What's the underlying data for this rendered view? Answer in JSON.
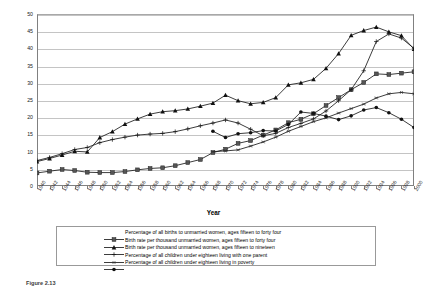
{
  "chart_data": {
    "type": "line",
    "title": "",
    "xlabel": "Year",
    "ylabel": "",
    "xlim": [
      1940,
      2000
    ],
    "ylim": [
      0,
      50
    ],
    "ytick_step": 5,
    "xtick_step": 2,
    "grid": "horizontal",
    "legend_position": "bottom",
    "yticks": [
      0,
      5,
      10,
      15,
      20,
      25,
      30,
      35,
      40,
      45,
      50
    ],
    "xticks": [
      1940,
      1942,
      1944,
      1946,
      1948,
      1950,
      1952,
      1954,
      1956,
      1958,
      1960,
      1962,
      1964,
      1966,
      1968,
      1970,
      1972,
      1974,
      1976,
      1978,
      1980,
      1982,
      1984,
      1986,
      1988,
      1990,
      1992,
      1994,
      1996,
      1998,
      2000
    ],
    "x": [
      1940,
      1942,
      1944,
      1946,
      1948,
      1950,
      1952,
      1954,
      1956,
      1958,
      1960,
      1962,
      1964,
      1966,
      1968,
      1970,
      1972,
      1974,
      1976,
      1978,
      1980,
      1982,
      1984,
      1986,
      1988,
      1990,
      1992,
      1994,
      1996,
      1998,
      2000
    ],
    "series": [
      {
        "name": "Percentage of all births to unmarried women, ages fifteen to forty four",
        "marker": "square",
        "values": [
          3.8,
          4.3,
          4.8,
          4.5,
          4.0,
          3.9,
          3.9,
          4.2,
          4.7,
          5.1,
          5.3,
          5.9,
          6.8,
          7.7,
          9.7,
          10.7,
          12.4,
          13.2,
          14.8,
          16.3,
          18.4,
          19.4,
          21.0,
          23.4,
          25.7,
          28.0,
          30.1,
          32.6,
          32.4,
          32.8,
          33.2
        ]
      },
      {
        "name": "Birth rate per thousand unmarried women, ages fifteen to forty four",
        "marker": "triangle",
        "values": [
          7.1,
          8.0,
          9.0,
          10.1,
          9.9,
          14.1,
          15.8,
          18.0,
          19.5,
          20.9,
          21.6,
          21.9,
          22.4,
          23.2,
          24.1,
          26.4,
          24.8,
          23.9,
          24.3,
          25.7,
          29.4,
          30.0,
          31.0,
          34.2,
          38.5,
          43.8,
          45.2,
          46.2,
          44.8,
          43.7,
          39.8
        ]
      },
      {
        "name": "Birth rate per thousand unmarried women, ages fifteen to nineteen",
        "marker": "plus",
        "values": [
          7.4,
          8.3,
          9.4,
          10.6,
          11.2,
          12.6,
          13.5,
          14.2,
          14.8,
          15.1,
          15.3,
          15.8,
          16.6,
          17.5,
          18.3,
          19.2,
          18.3,
          16.5,
          14.6,
          15.3,
          17.0,
          18.2,
          19.5,
          21.8,
          24.8,
          28.0,
          33.5,
          42.0,
          44.2,
          43.0,
          40.0
        ]
      },
      {
        "name": "Percentage of all children under eighteen living with one parent",
        "marker": "asterisk",
        "values": [
          null,
          null,
          null,
          null,
          null,
          null,
          null,
          null,
          null,
          null,
          null,
          null,
          null,
          null,
          10.0,
          10.2,
          10.5,
          11.6,
          12.8,
          14.2,
          15.9,
          17.3,
          18.7,
          19.8,
          21.2,
          22.5,
          23.8,
          25.6,
          26.8,
          27.2,
          26.8
        ]
      },
      {
        "name": "Percentage of all children under eighteen living in poverty",
        "marker": "diamond",
        "values": [
          null,
          null,
          null,
          null,
          null,
          null,
          null,
          null,
          null,
          null,
          null,
          null,
          null,
          null,
          15.9,
          14.1,
          15.2,
          15.5,
          16.1,
          16.0,
          17.9,
          21.5,
          21.1,
          20.3,
          19.3,
          20.4,
          22.1,
          22.8,
          21.3,
          19.4,
          17.0
        ]
      }
    ]
  },
  "legend": {
    "entries": [
      "Percentage of all births to unmarried women, ages fifteen to forty four",
      "Birth rate per thousand unmarried women, ages fifteen to forty four",
      "Birth rate per thousand unmarried women, ages fifteen to nineteen",
      "Percentage of all children under eighteen living with one parent",
      "Percentage of all children under eighteen living in poverty"
    ]
  },
  "caption": "Figure 2.13",
  "colors": {
    "series": "#1a1a1a",
    "grid": "#c4c4c4",
    "axis": "#808080",
    "background": "#ffffff"
  }
}
